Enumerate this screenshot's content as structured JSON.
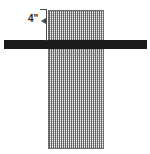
{
  "figure": {
    "background_color": "#ffffff"
  },
  "column": {
    "name": "hatched-column",
    "fill_color": "#b4b4b4",
    "hatch_color": "#5a5a5a",
    "outline_color": "#6f6f6f"
  },
  "beam": {
    "name": "horizontal-beam",
    "color": "#1a1a1a"
  },
  "dimension": {
    "label": "4\"",
    "line_color": "#4a4a4a",
    "text_color": "#2b2b2b"
  }
}
